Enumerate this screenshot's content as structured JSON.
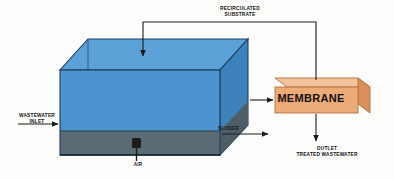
{
  "diagram": {
    "type": "process-flow-diagram",
    "title_visible": false,
    "background_color": "#fdfdfc"
  },
  "tank": {
    "name": "bioreactor-tank",
    "body_color": "#4a90cd",
    "top_face_color": "#5ba3da",
    "side_face_color": "#3e7fb8",
    "sludge_color": "#5a6b74",
    "sludge_floor_color": "#56676f",
    "outline_color": "#1f3d5c"
  },
  "membrane": {
    "name": "membrane-unit",
    "label": "MEMBRANE",
    "front_face_color": "#edab78",
    "top_face_color": "#f2c39b",
    "side_face_color": "#d9905c",
    "outline_color": "#b36f3f"
  },
  "diffuser": {
    "name": "air-diffuser",
    "color": "#1c1c1c"
  },
  "labels": {
    "recirculated_substrate": "RECIRCULATED\nSUBSTRATE",
    "wastewater_inlet": "WASTEWATER\nINLET",
    "sludge": "SLUDGE",
    "air": "AIR",
    "outlet_treated_wastewater": "OUTLET\nTREATED WASTEWATER"
  },
  "flows": [
    {
      "id": "wastewater-inlet-arrow",
      "from": "external-left",
      "to": "tank",
      "direction": "right"
    },
    {
      "id": "sludge-to-membrane-arrow",
      "from": "tank",
      "to": "membrane",
      "direction": "right"
    },
    {
      "id": "sludge-waste-arrow",
      "from": "tank",
      "to": "external-right",
      "direction": "right"
    },
    {
      "id": "recirculation-arrow",
      "from": "membrane",
      "to": "tank",
      "direction": "down-into-tank"
    },
    {
      "id": "air-supply-line",
      "from": "external-below",
      "to": "diffuser",
      "direction": "up"
    },
    {
      "id": "outlet-arrow",
      "from": "membrane",
      "to": "external-below",
      "direction": "down"
    }
  ],
  "colors": {
    "line_color": "#1a1a1a",
    "text_color": "#111111"
  }
}
